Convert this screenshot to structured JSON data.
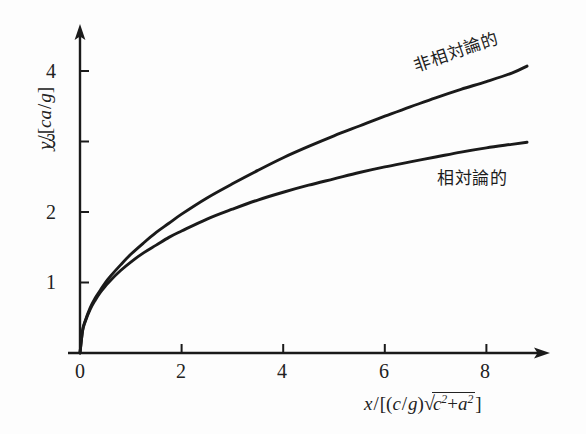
{
  "figure": {
    "background_color": "#fdfdfd",
    "ink_color": "#1a1a1a"
  },
  "axes": {
    "x_label_parts": {
      "var": "x",
      "slash": "/",
      "open_bracket": "[",
      "open_paren": "(",
      "c": "c",
      "inner_slash": "/",
      "g": "g",
      "close_paren": ")",
      "sqrt": "√",
      "c_base": "c",
      "c_exp": "2",
      "plus": "+",
      "a_base": "a",
      "a_exp": "2",
      "close_bracket": "]"
    },
    "y_label_parts": {
      "var": "y",
      "slash": "/",
      "open_bracket": "[",
      "c": "c",
      "a": "a",
      "inner_slash": "/",
      "g": "g",
      "close_bracket": "]"
    },
    "x_label_plain": "x/[(c/g)√(c²+a²)]",
    "y_label_plain": "y/[ca/g]"
  },
  "chart_data": {
    "type": "line",
    "title": "",
    "xlabel": "x/[(c/g)√(c²+a²)]",
    "ylabel": "y/[ca/g]",
    "xlim": [
      0,
      9.2
    ],
    "ylim": [
      0,
      4.65
    ],
    "xticks": [
      0,
      2,
      4,
      6,
      8
    ],
    "xtick_labels": [
      "0",
      "2",
      "4",
      "6",
      "8"
    ],
    "yticks": [
      1,
      2,
      3,
      4
    ],
    "ytick_labels": [
      "1",
      "2",
      "3",
      "4"
    ],
    "grid": false,
    "legend": "inline-curve-labels",
    "axis_style": "arrow-tipped-half-axes",
    "series": [
      {
        "name": "非相対論的",
        "label_en_hint": "non-relativistic",
        "color": "#1a1a1a",
        "label_position": {
          "x": 6.6,
          "y": 3.9,
          "rotation_deg": -19
        },
        "x": [
          0,
          0.05,
          0.1,
          0.2,
          0.3,
          0.4,
          0.5,
          0.6,
          0.8,
          1.0,
          1.25,
          1.5,
          1.75,
          2.0,
          2.5,
          3.0,
          3.5,
          4.0,
          4.5,
          5.0,
          5.5,
          6.0,
          6.5,
          7.0,
          7.5,
          8.0,
          8.5,
          8.8
        ],
        "y": [
          0,
          0.32,
          0.45,
          0.64,
          0.78,
          0.89,
          1.0,
          1.09,
          1.25,
          1.4,
          1.56,
          1.71,
          1.84,
          1.97,
          2.2,
          2.4,
          2.59,
          2.77,
          2.93,
          3.08,
          3.22,
          3.36,
          3.49,
          3.62,
          3.74,
          3.85,
          3.97,
          4.07
        ]
      },
      {
        "name": "相対論的",
        "label_en_hint": "relativistic",
        "color": "#1a1a1a",
        "label_position": {
          "x": 7.1,
          "y": 2.65,
          "rotation_deg": 0
        },
        "x": [
          0,
          0.05,
          0.1,
          0.2,
          0.3,
          0.4,
          0.5,
          0.6,
          0.8,
          1.0,
          1.25,
          1.5,
          1.75,
          2.0,
          2.5,
          3.0,
          3.5,
          4.0,
          4.5,
          5.0,
          5.5,
          6.0,
          6.5,
          7.0,
          7.5,
          8.0,
          8.5,
          8.8
        ],
        "y": [
          0,
          0.31,
          0.44,
          0.62,
          0.75,
          0.86,
          0.95,
          1.03,
          1.17,
          1.29,
          1.42,
          1.53,
          1.64,
          1.73,
          1.9,
          2.04,
          2.17,
          2.28,
          2.38,
          2.47,
          2.56,
          2.64,
          2.71,
          2.78,
          2.85,
          2.91,
          2.96,
          2.99
        ]
      }
    ]
  }
}
